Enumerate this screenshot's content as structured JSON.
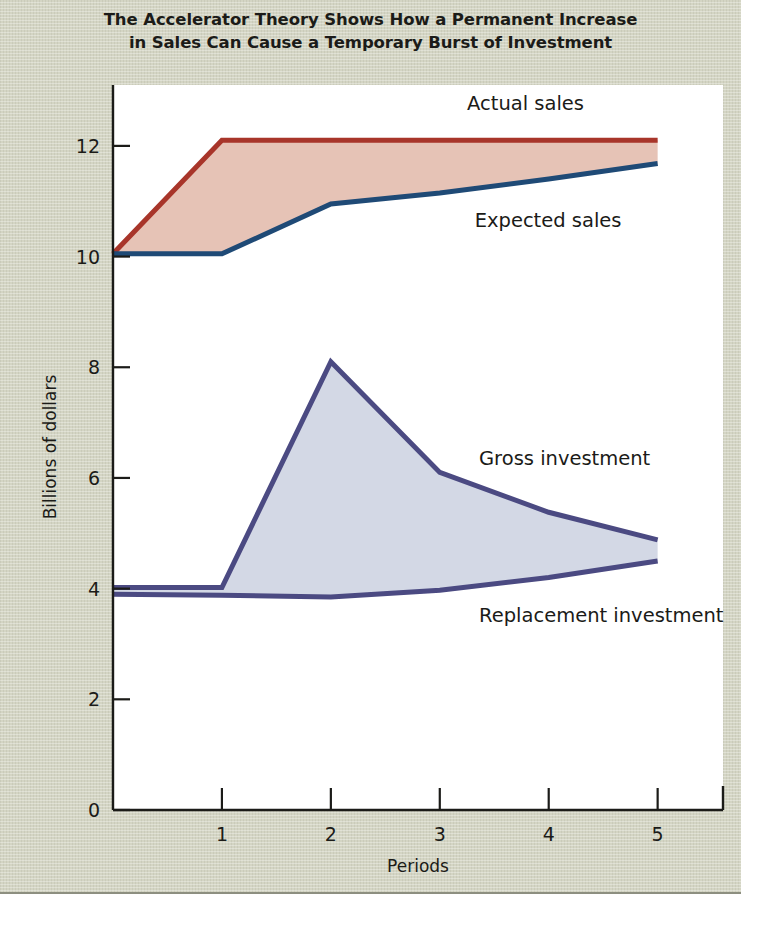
{
  "figure": {
    "title": "The Accelerator Theory Shows How a Permanent Increase\nin Sales Can Cause a Temporary Burst of Investment",
    "background_color": "#d4d5c4",
    "plot_background_color": "#ffffff"
  },
  "chart_data": {
    "type": "line",
    "title": "The Accelerator Theory Shows How a Permanent Increase in Sales Can Cause a Temporary Burst of Investment",
    "xlabel": "Periods",
    "ylabel": "Billions of dollars",
    "xlim": [
      0,
      5.6
    ],
    "ylim": [
      0,
      13.1
    ],
    "xticks": [
      1,
      2,
      3,
      4,
      5
    ],
    "xtick_labels": [
      "1",
      "2",
      "3",
      "4",
      "5"
    ],
    "yticks": [
      0,
      2,
      4,
      6,
      8,
      10,
      12
    ],
    "ytick_labels": [
      "0",
      "2",
      "4",
      "6",
      "8",
      "10",
      "12"
    ],
    "grid": false,
    "legend_position": "inline-annotations",
    "x": [
      0,
      1,
      2,
      3,
      4,
      5
    ],
    "series": [
      {
        "name": "Actual sales",
        "color": "#a8352a",
        "fill_to": "Expected sales",
        "fill_color": "#e6c3b6",
        "values": [
          10.05,
          12.1,
          12.1,
          12.1,
          12.1,
          12.1
        ],
        "label_x": 3.25,
        "label_y": 12.75
      },
      {
        "name": "Expected sales",
        "color": "#1f4a76",
        "values": [
          10.05,
          10.05,
          10.95,
          11.15,
          11.4,
          11.68
        ],
        "label_x": 3.32,
        "label_y": 10.65
      },
      {
        "name": "Gross investment",
        "color": "#4b4a82",
        "fill_to": "Replacement investment",
        "fill_color": "#d3d8e5",
        "values": [
          4.02,
          4.02,
          8.1,
          6.1,
          5.38,
          4.88
        ],
        "label_x": 3.36,
        "label_y": 6.35
      },
      {
        "name": "Replacement investment",
        "color": "#4b4a82",
        "values": [
          3.9,
          3.88,
          3.85,
          3.97,
          4.2,
          4.5
        ],
        "label_x": 3.36,
        "label_y": 3.5
      }
    ]
  }
}
